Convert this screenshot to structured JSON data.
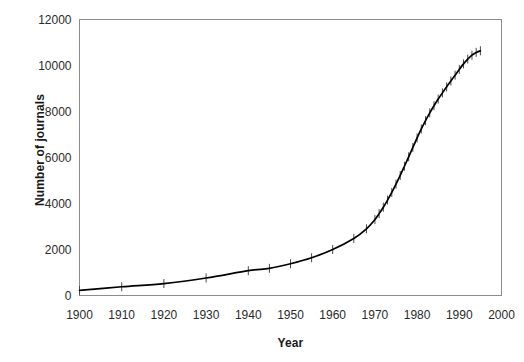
{
  "chart_data": {
    "type": "line",
    "title": "",
    "subtitle": "",
    "xlabel": "Year",
    "ylabel": "Number of journals",
    "xlim": [
      1900,
      2000
    ],
    "ylim": [
      0,
      12000
    ],
    "grid": false,
    "legend": null,
    "legend_position": "none",
    "x_ticks": [
      "1900",
      "1910",
      "1920",
      "1930",
      "1940",
      "1950",
      "1960",
      "1970",
      "1980",
      "1990",
      "2000"
    ],
    "y_ticks": [
      "0",
      "2000",
      "4000",
      "6000",
      "8000",
      "10000",
      "12000"
    ],
    "marker": "plus",
    "line_color": "#000000",
    "frame_color": "#808080",
    "background_color": "#ffffff",
    "series": [
      {
        "name": "Number of journals",
        "x": [
          1900,
          1910,
          1920,
          1930,
          1940,
          1945,
          1950,
          1955,
          1960,
          1965,
          1968,
          1970,
          1971,
          1972,
          1973,
          1974,
          1975,
          1976,
          1977,
          1978,
          1979,
          1980,
          1981,
          1982,
          1983,
          1984,
          1985,
          1986,
          1987,
          1988,
          1989,
          1990,
          1991,
          1992,
          1993,
          1994,
          1995
        ],
        "values": [
          220,
          380,
          520,
          760,
          1080,
          1180,
          1380,
          1640,
          2000,
          2480,
          2900,
          3300,
          3560,
          3840,
          4150,
          4480,
          4840,
          5220,
          5620,
          6030,
          6440,
          6850,
          7240,
          7600,
          7940,
          8250,
          8540,
          8810,
          9070,
          9330,
          9580,
          9830,
          10070,
          10280,
          10450,
          10570,
          10640
        ]
      }
    ]
  },
  "axes": {
    "y_axis_title": "Number of journals",
    "x_axis_title": "Year"
  }
}
